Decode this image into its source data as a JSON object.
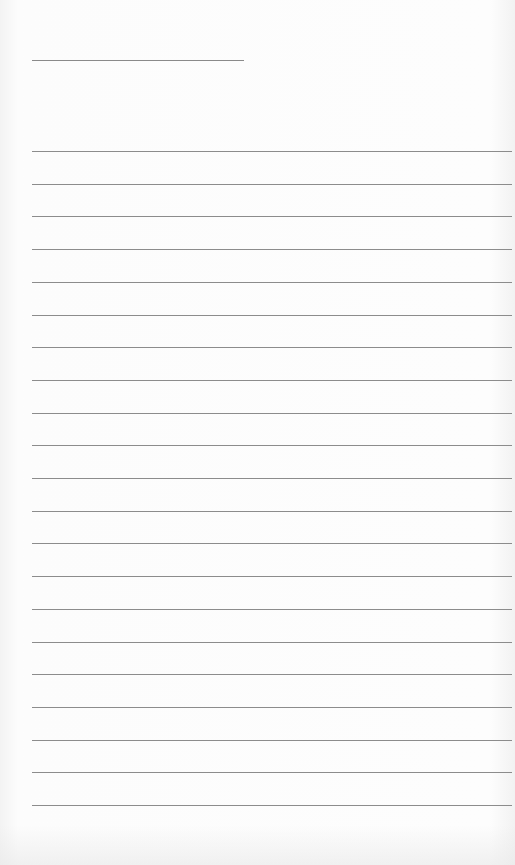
{
  "document": {
    "type": "lined-notepaper",
    "title_line": {
      "x": 32,
      "y": 60,
      "width": 212
    },
    "ruled_lines": {
      "count": 21,
      "start_y": 151,
      "spacing": 32.7,
      "x": 32,
      "width": 480
    },
    "colors": {
      "paper": "#fbfbfb",
      "line": "#8c8c8c"
    }
  }
}
